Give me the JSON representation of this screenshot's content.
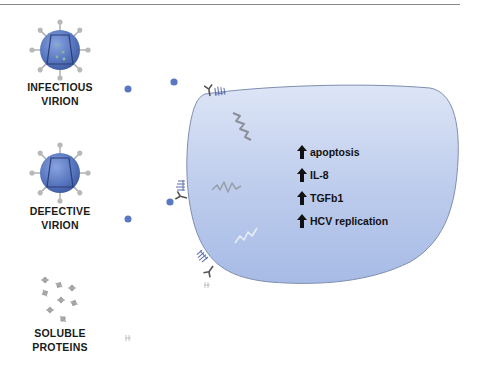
{
  "particles": [
    {
      "id": "infectious",
      "label_line1": "INFECTIOUS",
      "label_line2": "VIRION"
    },
    {
      "id": "defective",
      "label_line1": "DEFECTIVE",
      "label_line2": "VIRION"
    },
    {
      "id": "soluble",
      "label_line1": "SOLUBLE",
      "label_line2": "PROTEINS"
    }
  ],
  "cell": {
    "effects": [
      {
        "direction": "up",
        "label": "apoptosis"
      },
      {
        "direction": "up",
        "label": "IL-8"
      },
      {
        "direction": "up",
        "label": "TGFb1"
      },
      {
        "direction": "up",
        "label": "HCV replication"
      }
    ]
  },
  "colors": {
    "virion": "#5a78c0",
    "cell_fill": "#b9c9ec",
    "cell_stroke": "#7f8fae",
    "receptor": "#5a6ea8",
    "signal": "#8a8f99"
  }
}
